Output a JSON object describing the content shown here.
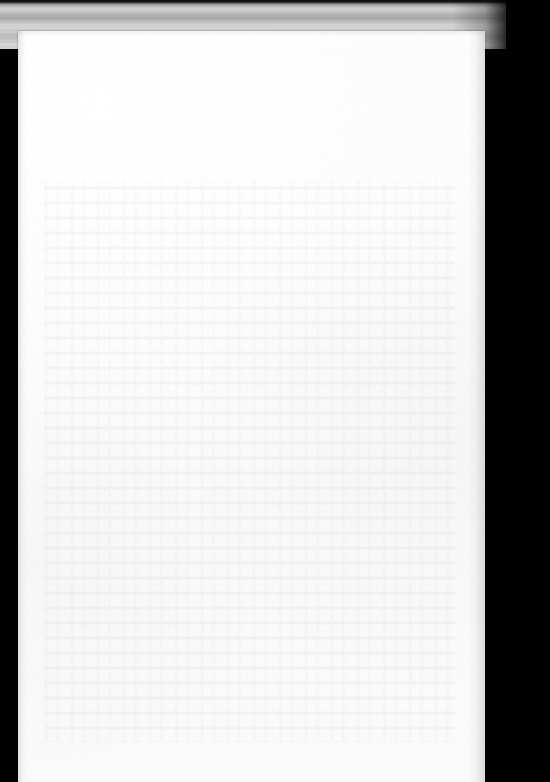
{
  "document": {
    "kind": "scanned-page",
    "page_content": "",
    "page_note": "",
    "visible_text": ""
  },
  "scan": {
    "canvas_width": "550",
    "canvas_height": "782",
    "background_color": "#010101",
    "paper_color": "#fdfdfd",
    "platen_band_color": "#cdcdcd",
    "paper_left": "18",
    "paper_top": "31",
    "paper_width": "467",
    "paper_height": "751",
    "band_width": "506",
    "band_height": "49"
  },
  "regions": {
    "scanner_bed_label": "",
    "platen_band_label": "",
    "paper_sheet_label": "",
    "showthrough_label": ""
  }
}
